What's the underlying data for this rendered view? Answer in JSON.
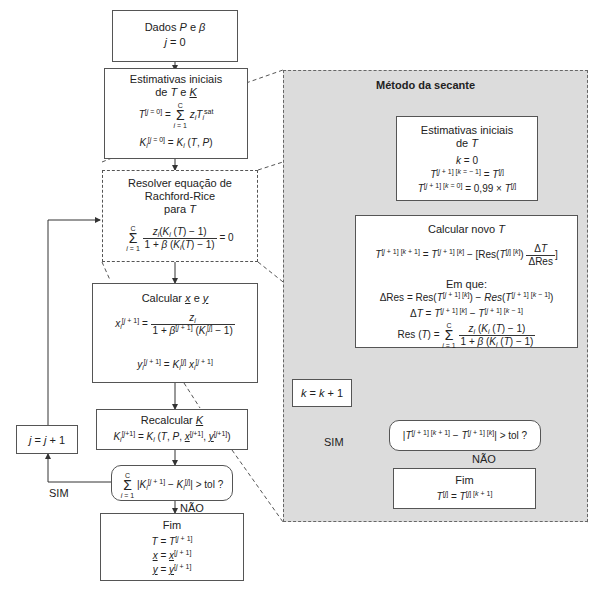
{
  "left_flow": {
    "start": {
      "line1": "Dados P e β",
      "line2": "j = 0"
    },
    "initial_estimates": {
      "title1": "Estimativas iniciais",
      "title2": "de T e K",
      "eq1_lhs": "T",
      "eq1_sup": "[j = 0]",
      "eq1_rhs": "= Σ z_i T_i^sat",
      "eq2": "K_i^[j = 0] = K_i (T, P)"
    },
    "rachford_rice": {
      "title1": "Resolver equação de",
      "title2": "Rachford-Rice",
      "title3": "para T",
      "eq_num": "z_i(K_i (T) − 1)",
      "eq_den": "1 + β (K_i(T) − 1)",
      "eq_rhs": "= 0"
    },
    "calc_xy": {
      "title": "Calcular x e y",
      "eq_x": "x_i^[j+1] = z_i / (1 + β^[j+1] (K_i^[j] − 1))",
      "eq_y": "y_i^[j+1] = K_i^[j] x_i^[j+1]"
    },
    "recalc_k": {
      "title": "Recalcular K",
      "eq": "K_i^[j+1] = K_i (T, P, x^[j+1], y^[j+1])"
    },
    "convergence_check": {
      "text": "Σ |K_i^[j+1] − K_i^[j]| > tol ?"
    },
    "increment": {
      "text": "j = j + 1"
    },
    "yes_label": "SIM",
    "no_label": "NÃO",
    "end": {
      "title": "Fim",
      "eq1": "T = T^[j+1]",
      "eq2": "x = x^[j+1]",
      "eq3": "y = y^[j+1]"
    }
  },
  "secant_panel": {
    "title": "Método da secante",
    "initial_estimates": {
      "title1": "Estimativas iniciais",
      "title2": "de T",
      "eq1": "k = 0",
      "eq2": "T^[j+1][k−1] = T^[j]",
      "eq3": "T^[j+1][k=0] = 0,99 × T^[j]"
    },
    "calc_new_t": {
      "title": "Calcular novo T",
      "eq_main": "T^[j+1][k+1] = T^[j+1][k] − [Res(T^[j][k]) ΔT/ΔRes]",
      "where": "Em que:",
      "eq_dres": "ΔRes = Res(T^[j+1][k]) − Res(T^[j+1][k−1])",
      "eq_dt": "ΔT = T^[j+1][k] − T^[j+1][k−1]",
      "eq_res": "Res (T) = Σ z_i (K_i (T) − 1) / (1 + β (K_i (T) − 1))"
    },
    "increment": {
      "text": "k = k + 1"
    },
    "convergence_check": {
      "text": "|T^[j+1][k+1] − T^[j+1][k]| > tol ?"
    },
    "yes_label": "SIM",
    "no_label": "NÃO",
    "end": {
      "title": "Fim",
      "eq": "T^[j] = T^[j][k+1]"
    }
  },
  "colors": {
    "panel_bg": "#dcdcdc",
    "border": "#555555",
    "box_bg": "#ffffff"
  }
}
